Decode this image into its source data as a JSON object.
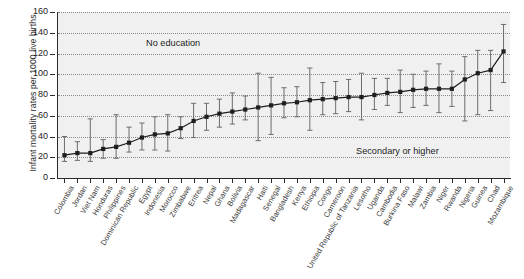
{
  "chart_data": {
    "type": "scatter",
    "title": "",
    "xlabel": "",
    "ylabel": "Infant mortality rates per 1000 live births",
    "ylim": [
      0,
      160
    ],
    "yticks": [
      0,
      20,
      40,
      60,
      80,
      100,
      120,
      140,
      160
    ],
    "grid": true,
    "legend": "none",
    "annotations": [
      {
        "text": "No education",
        "x_index": 6,
        "y": 126
      },
      {
        "text": "Secondary or higher",
        "x_index": 30,
        "y": 28
      }
    ],
    "series_note": "Point = infant mortality rate; whiskers = uncertainty interval (lower, upper)",
    "categories": [
      "Colombia",
      "Jordan",
      "Viet Nam",
      "Honduras",
      "Philippines",
      "Dominican Republic",
      "Egypt",
      "Indonesia",
      "Morocco",
      "Zimbabwe",
      "Eritrea",
      "Nepal",
      "Ghana",
      "Bolivia",
      "Madagascar",
      "Haiti",
      "Senegal",
      "Bangladesh",
      "Kenya",
      "Ethiopia",
      "Congo",
      "Cameroon",
      "United Republic of Tanzania",
      "Lesotho",
      "Uganda",
      "Cambodia",
      "Burkina Faso",
      "Malawi",
      "Zambia",
      "Niger",
      "Rwanda",
      "Nigeria",
      "Guinea",
      "Chad",
      "Mozambique"
    ],
    "values": [
      22,
      24,
      24,
      28,
      30,
      34,
      39,
      42,
      43,
      48,
      55,
      59,
      62,
      64,
      66,
      68,
      70,
      72,
      73,
      75,
      76,
      77,
      78,
      78,
      80,
      82,
      83,
      85,
      86,
      86,
      86,
      95,
      101,
      104,
      122
    ],
    "lower": [
      16,
      17,
      16,
      19,
      19,
      25,
      27,
      27,
      26,
      38,
      39,
      46,
      49,
      52,
      56,
      36,
      42,
      58,
      59,
      46,
      61,
      62,
      64,
      56,
      66,
      70,
      63,
      68,
      70,
      63,
      69,
      55,
      61,
      65,
      92
    ],
    "upper": [
      40,
      35,
      57,
      37,
      61,
      49,
      53,
      59,
      61,
      59,
      72,
      72,
      76,
      82,
      79,
      101,
      97,
      87,
      88,
      106,
      92,
      93,
      95,
      101,
      96,
      96,
      104,
      100,
      103,
      110,
      103,
      117,
      123,
      123,
      148
    ]
  },
  "axis": {
    "y_title": "Infant mortality rates per 1000 live births",
    "y_tick_labels": [
      "0",
      "20",
      "40",
      "60",
      "80",
      "100",
      "120",
      "140",
      "160"
    ]
  },
  "annotations": {
    "no_education": "No education",
    "secondary_or_higher": "Secondary or higher"
  }
}
